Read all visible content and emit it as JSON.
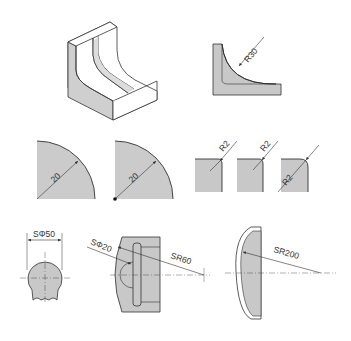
{
  "figures": {
    "iso_block": {
      "description": "isometric view of L-bracket with concave fillet"
    },
    "section_r30": {
      "label": "R30"
    },
    "quarter_circle_1": {
      "label": "20"
    },
    "quarter_circle_2": {
      "label": "20"
    },
    "fillet_1": {
      "label": "R2"
    },
    "fillet_2": {
      "label": "R2"
    },
    "fillet_3": {
      "label": "R2"
    },
    "sphere_diameter": {
      "label": "SΦ50"
    },
    "sphere_section": {
      "label_small": "SΦ20",
      "label_large": "SR60"
    },
    "sphere_radius_large": {
      "label": "SR200"
    }
  },
  "colors": {
    "fill": "#c8c8c8",
    "stroke": "#333333",
    "background": "#ffffff"
  }
}
